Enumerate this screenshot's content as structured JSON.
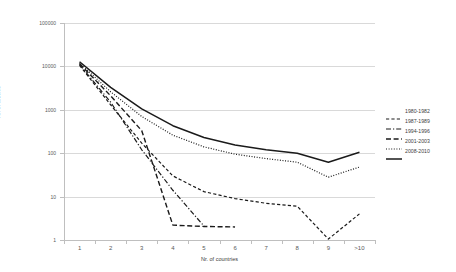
{
  "chart_data": {
    "type": "line",
    "title": "",
    "xlabel": "Nr. of countries",
    "ylabel": "Nr. of articles",
    "x_categories": [
      "1",
      "2",
      "3",
      "4",
      "5",
      "6",
      "7",
      "8",
      "9",
      ">10"
    ],
    "y_scale": "log",
    "ylim": [
      1,
      100000
    ],
    "y_ticks": [
      "1",
      "10",
      "100",
      "1000",
      "10000",
      "100000"
    ],
    "grid": true,
    "legend_position": "right",
    "series": [
      {
        "name": "1980-1982",
        "style": "dashed",
        "color": "#1a1a1a",
        "values": [
          10500,
          1300,
          170,
          30,
          13,
          9,
          7,
          6,
          1.05,
          4
        ]
      },
      {
        "name": "1987-1989",
        "style": "dash-dot",
        "color": "#1a1a1a",
        "values": [
          11000,
          1500,
          120,
          14,
          2.1,
          null,
          null,
          null,
          null,
          null
        ]
      },
      {
        "name": "1994-1996",
        "style": "long-dash",
        "color": "#1a1a1a",
        "values": [
          11500,
          2100,
          330,
          2.2,
          2.05,
          2.0,
          null,
          null,
          null,
          null
        ]
      },
      {
        "name": "2001-2003",
        "style": "dotted",
        "color": "#1a1a1a",
        "values": [
          12000,
          2600,
          700,
          260,
          140,
          95,
          75,
          62,
          28,
          48
        ]
      },
      {
        "name": "2008-2010",
        "style": "solid",
        "color": "#1a1a1a",
        "values": [
          12800,
          3300,
          1050,
          430,
          230,
          155,
          120,
          100,
          62,
          105
        ]
      }
    ]
  },
  "axes": {
    "y_title": "Nr. of articles",
    "x_title": "Nr. of countries"
  }
}
